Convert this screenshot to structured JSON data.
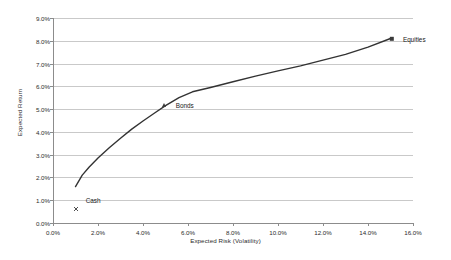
{
  "chart_data": {
    "type": "line",
    "title": "",
    "xlabel": "Expected Risk (Volatility)",
    "ylabel": "Expected Return",
    "xlim": [
      0.0,
      16.0
    ],
    "ylim": [
      0.0,
      9.0
    ],
    "xticks": [
      "0.0%",
      "2.0%",
      "4.0%",
      "6.0%",
      "8.0%",
      "10.0%",
      "12.0%",
      "14.0%",
      "16.0%"
    ],
    "xtick_values": [
      0.0,
      2.0,
      4.0,
      6.0,
      8.0,
      10.0,
      12.0,
      14.0,
      16.0
    ],
    "yticks": [
      "0.0%",
      "1.0%",
      "2.0%",
      "3.0%",
      "4.0%",
      "5.0%",
      "6.0%",
      "7.0%",
      "8.0%",
      "9.0%"
    ],
    "ytick_values": [
      0.0,
      1.0,
      2.0,
      3.0,
      4.0,
      5.0,
      6.0,
      7.0,
      8.0,
      9.0
    ],
    "grid": "horizontal",
    "legend": "none",
    "series": [
      {
        "name": "Efficient Frontier",
        "color": "#333333",
        "x": [
          1.0,
          1.3,
          1.6,
          2.0,
          2.5,
          3.0,
          3.5,
          4.0,
          4.5,
          5.0,
          5.6,
          6.2,
          7.0,
          8.0,
          9.0,
          10.0,
          11.0,
          12.0,
          13.0,
          14.0,
          15.0
        ],
        "y": [
          1.6,
          2.1,
          2.45,
          2.85,
          3.3,
          3.72,
          4.12,
          4.48,
          4.82,
          5.15,
          5.5,
          5.76,
          5.95,
          6.2,
          6.45,
          6.68,
          6.9,
          7.15,
          7.4,
          7.72,
          8.1
        ]
      }
    ],
    "points": [
      {
        "name": "Cash",
        "label": "Cash",
        "x": 1.0,
        "y": 1.0,
        "marker": "x-cross",
        "label_x": 1.45
      },
      {
        "name": "Bonds",
        "label": "Bonds",
        "x": 4.95,
        "y": 5.2,
        "marker": "triangle",
        "label_x": 5.45
      },
      {
        "name": "Equities",
        "label": "Equities",
        "x": 15.05,
        "y": 8.1,
        "marker": "square",
        "label_x": 15.55
      }
    ],
    "annotations": []
  }
}
